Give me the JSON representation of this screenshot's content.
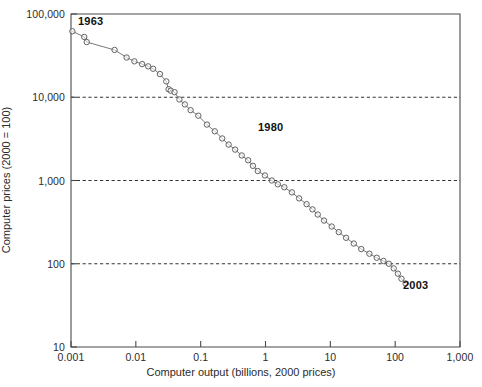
{
  "chart_data": {
    "type": "line",
    "title": "",
    "xlabel": "Computer output (billions, 2000 prices)",
    "ylabel": "Computer prices (2000 = 100)",
    "xscale": "log",
    "yscale": "log",
    "xlim": [
      0.001,
      1000
    ],
    "ylim": [
      10,
      100000
    ],
    "grid": "horizontal-dashed",
    "legend": "none",
    "xticks": [
      "0.001",
      "0.01",
      "0.1",
      "1",
      "10",
      "100",
      "1,000"
    ],
    "xtick_values": [
      0.001,
      0.01,
      0.1,
      1,
      10,
      100,
      1000
    ],
    "yticks": [
      "10",
      "100",
      "1,000",
      "10,000",
      "100,000"
    ],
    "ytick_values": [
      10,
      100,
      1000,
      10000,
      100000
    ],
    "gridline_values": [
      100,
      1000,
      10000
    ],
    "marker": "circle-open",
    "series": [
      {
        "name": "Computer prices vs output",
        "x": [
          0.00105,
          0.0016,
          0.00175,
          0.0047,
          0.0072,
          0.0095,
          0.0125,
          0.0155,
          0.0185,
          0.0235,
          0.0295,
          0.032,
          0.0345,
          0.0395,
          0.047,
          0.057,
          0.07,
          0.092,
          0.125,
          0.165,
          0.215,
          0.27,
          0.34,
          0.43,
          0.54,
          0.64,
          0.76,
          0.98,
          1.25,
          1.55,
          1.95,
          2.55,
          3.3,
          4.3,
          5.3,
          6.4,
          8.0,
          10.5,
          13.5,
          17.5,
          23,
          30,
          40,
          52,
          66,
          80,
          95,
          110,
          125,
          145
        ],
        "y": [
          62000,
          53000,
          46000,
          37000,
          30000,
          27000,
          25000,
          23500,
          22000,
          19000,
          15500,
          12500,
          12000,
          11500,
          9400,
          8200,
          7000,
          6000,
          4700,
          3900,
          3200,
          2700,
          2350,
          2000,
          1750,
          1500,
          1300,
          1150,
          1000,
          900,
          830,
          720,
          610,
          520,
          450,
          390,
          330,
          280,
          240,
          205,
          175,
          150,
          132,
          118,
          108,
          100,
          88,
          76,
          66,
          58
        ]
      }
    ],
    "annotations": [
      {
        "text": "1963",
        "x": 0.0016,
        "y": 78000
      },
      {
        "text": "1980",
        "x": 1.1,
        "y": 2600
      },
      {
        "text": "2003",
        "x": 230,
        "y": 60
      }
    ]
  },
  "axis": {
    "x_title": "Computer output (billions, 2000 prices)",
    "y_title": "Computer prices (2000 = 100)",
    "x_tick_labels": [
      "0.001",
      "0.01",
      "0.1",
      "1",
      "10",
      "100",
      "1,000"
    ],
    "y_tick_labels": [
      "100,000",
      "10,000",
      "1,000",
      "100",
      "10"
    ]
  },
  "annotations": {
    "start_year": "1963",
    "mid_year": "1980",
    "end_year": "2003"
  },
  "colors": {
    "axis": "#4a4a4a",
    "line": "#6a6a6a",
    "marker_stroke": "#5a5a5a",
    "gridline": "#333333",
    "text": "#1a1a1a",
    "background": "#ffffff"
  }
}
